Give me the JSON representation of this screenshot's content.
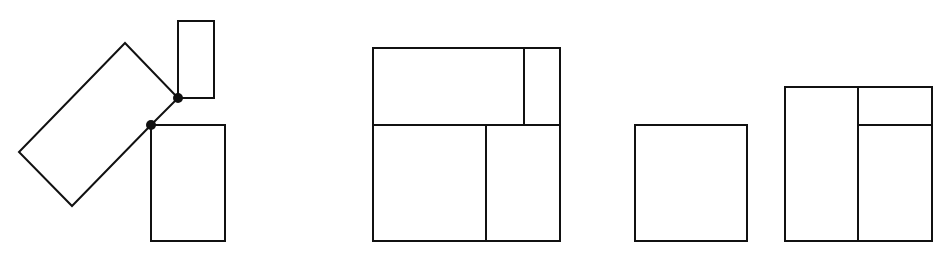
{
  "diagram": {
    "stroke_color": "#111111",
    "background": "#ffffff",
    "figures": [
      {
        "id": "figure-1",
        "description": "Rotated rectangle hinged at two points to two upright rectangles",
        "polygons": [
          {
            "name": "rotated-rectangle",
            "points": "125,43 178,98 151,125 72,206 19,152"
          },
          {
            "name": "upper-small-rectangle",
            "x": 178,
            "y": 21,
            "w": 36,
            "h": 77
          },
          {
            "name": "lower-rectangle",
            "x": 151,
            "y": 125,
            "w": 74,
            "h": 116
          }
        ],
        "hinges": [
          {
            "name": "upper-hinge-dot",
            "cx": 178,
            "cy": 98,
            "r": 5
          },
          {
            "name": "lower-hinge-dot",
            "cx": 151,
            "cy": 125,
            "r": 5
          }
        ]
      },
      {
        "id": "figure-2",
        "description": "Square subdivided into four rectangles",
        "outer": {
          "x": 373,
          "y": 48,
          "w": 187,
          "h": 193
        },
        "lines": [
          {
            "name": "horizontal-divider",
            "x1": 373,
            "y1": 125,
            "x2": 560,
            "y2": 125
          },
          {
            "name": "top-vertical-divider",
            "x1": 524,
            "y1": 48,
            "x2": 524,
            "y2": 125
          },
          {
            "name": "bottom-vertical-divider",
            "x1": 486,
            "y1": 125,
            "x2": 486,
            "y2": 241
          }
        ]
      },
      {
        "id": "figure-3",
        "description": "Single square",
        "outer": {
          "x": 635,
          "y": 125,
          "w": 112,
          "h": 116
        }
      },
      {
        "id": "figure-4",
        "description": "Rectangle subdivided into three rectangles",
        "outer": {
          "x": 785,
          "y": 87,
          "w": 147,
          "h": 154
        },
        "lines": [
          {
            "name": "vertical-divider",
            "x1": 858,
            "y1": 87,
            "x2": 858,
            "y2": 241
          },
          {
            "name": "right-horizontal-divider",
            "x1": 858,
            "y1": 125,
            "x2": 932,
            "y2": 125
          }
        ]
      }
    ]
  }
}
